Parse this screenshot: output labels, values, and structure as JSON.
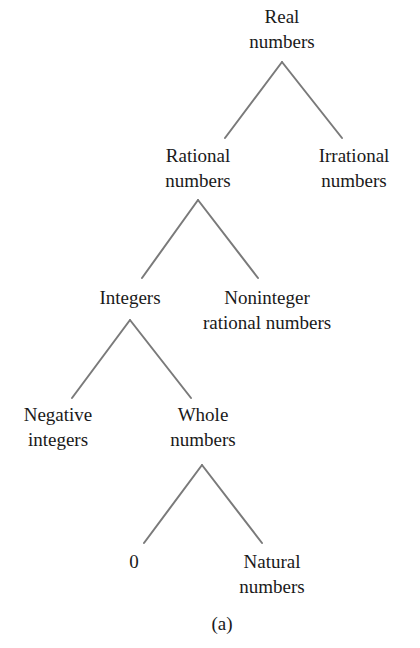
{
  "diagram": {
    "type": "tree",
    "caption": "(a)",
    "edge_color": "#7a7a7a",
    "nodes": {
      "real": {
        "line1": "Real",
        "line2": "numbers"
      },
      "rational": {
        "line1": "Rational",
        "line2": "numbers"
      },
      "irrational": {
        "line1": "Irrational",
        "line2": "numbers"
      },
      "integers": {
        "line1": "Integers"
      },
      "noninteger": {
        "line1": "Noninteger",
        "line2": "rational numbers"
      },
      "negative": {
        "line1": "Negative",
        "line2": "integers"
      },
      "whole": {
        "line1": "Whole",
        "line2": "numbers"
      },
      "zero": {
        "line1": "0"
      },
      "natural": {
        "line1": "Natural",
        "line2": "numbers"
      }
    },
    "edges": [
      [
        "Real numbers",
        "Rational numbers"
      ],
      [
        "Real numbers",
        "Irrational numbers"
      ],
      [
        "Rational numbers",
        "Integers"
      ],
      [
        "Rational numbers",
        "Noninteger rational numbers"
      ],
      [
        "Integers",
        "Negative integers"
      ],
      [
        "Integers",
        "Whole numbers"
      ],
      [
        "Whole numbers",
        "0"
      ],
      [
        "Whole numbers",
        "Natural numbers"
      ]
    ]
  }
}
